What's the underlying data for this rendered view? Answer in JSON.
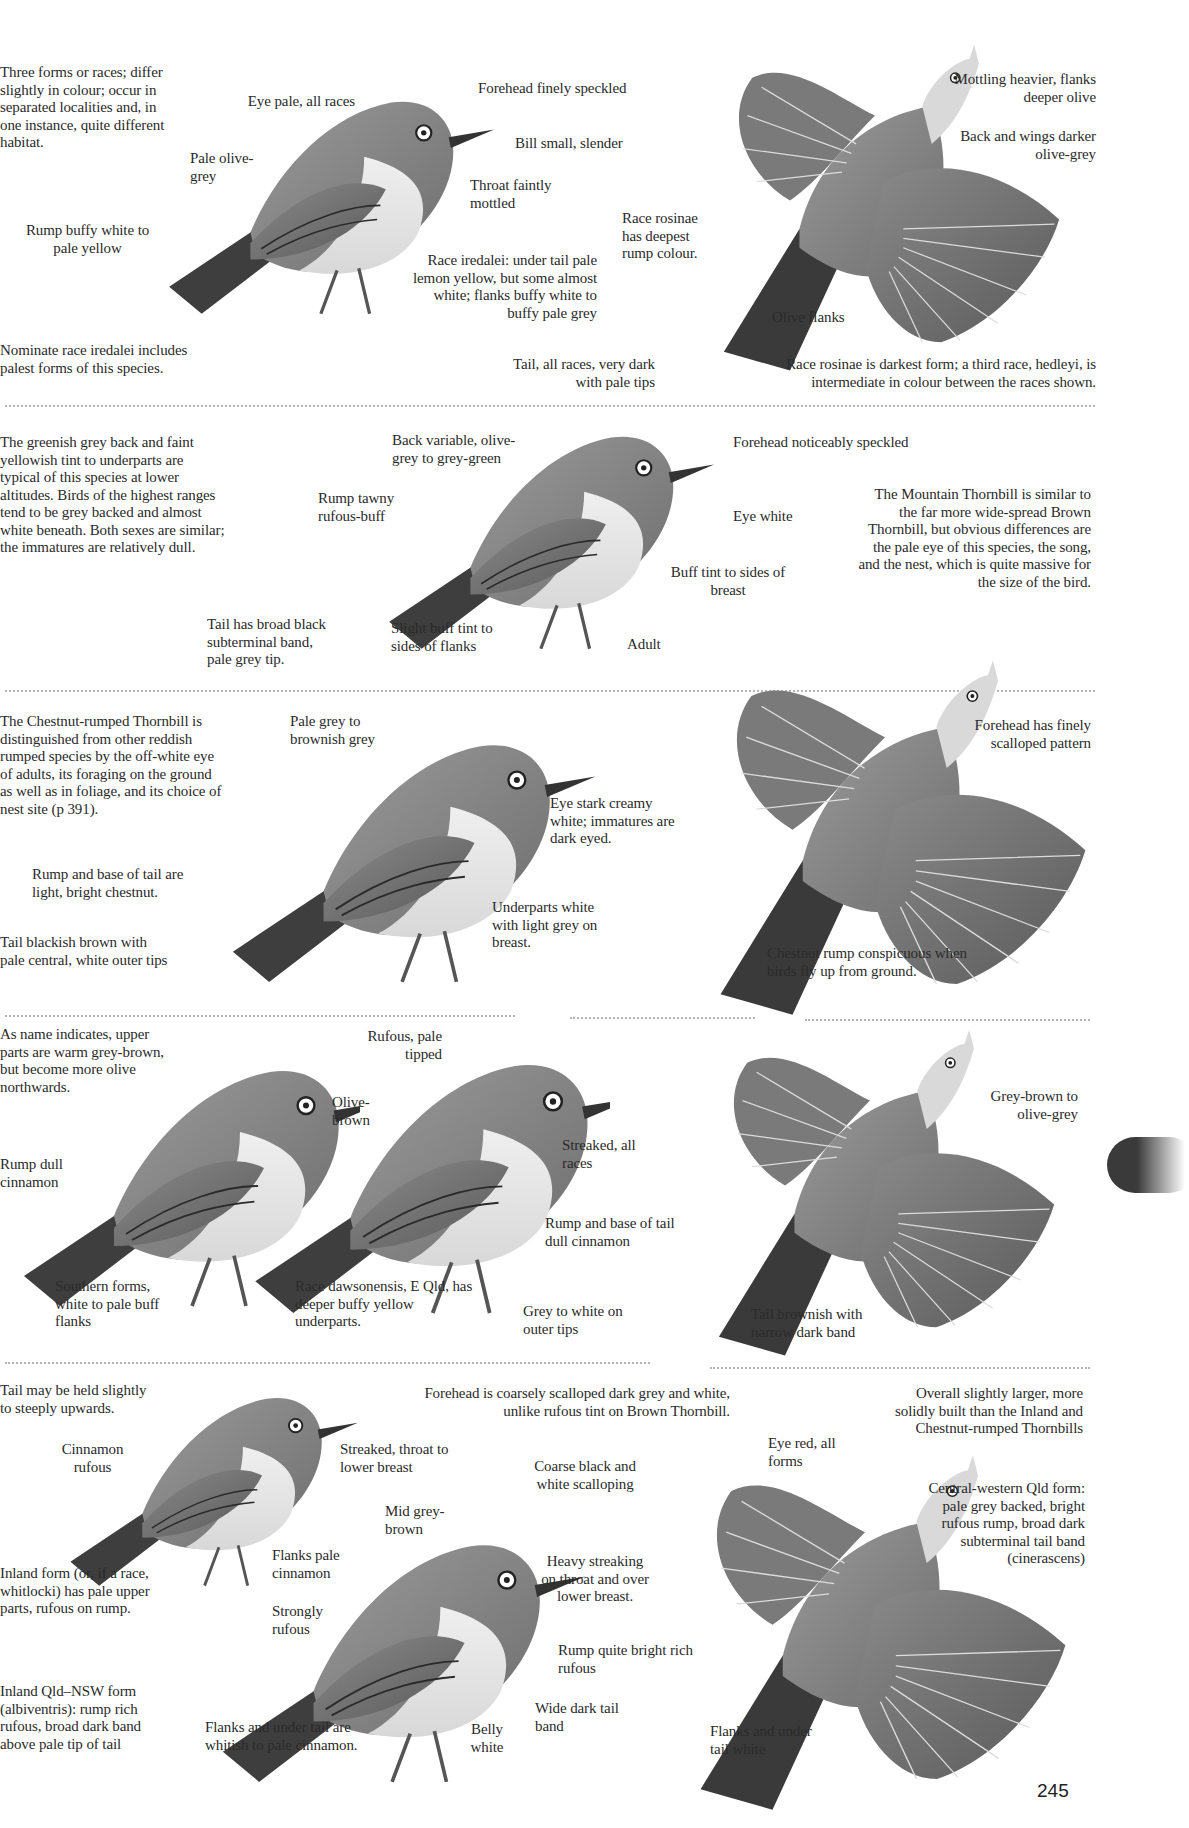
{
  "page": {
    "page_number": "245",
    "thumb_tab_color": "#3a3a3a"
  },
  "sections": [
    {
      "id": "section-1",
      "intro": "Three forms or races; differ slightly in colour; occur in separated localities and, in one instance, quite different habitat.",
      "footnote_left": "Nominate race iredalei includes palest forms of this species.",
      "footnote_right": "Race rosinae is darkest form; a third race, hedleyi, is intermediate in colour between the races shown.",
      "labels": [
        "Eye pale, all races",
        "Forehead finely speckled",
        "Bill small, slender",
        "Pale olive-grey",
        "Throat faintly mottled",
        "Rump buffy white to pale yellow",
        "Race iredalei: under tail pale lemon yellow, but some almost white; flanks buffy white to buffy pale grey",
        "Tail, all races, very dark with pale tips",
        "Race rosinae has deepest rump colour.",
        "Mottling heavier, flanks deeper olive",
        "Back and wings darker olive-grey",
        "Olive flanks"
      ]
    },
    {
      "id": "section-2",
      "intro": "The greenish grey back and faint yellowish tint to underparts are typical of this species at lower altitudes. Birds of the highest ranges tend to be grey backed and almost white beneath. Both sexes are similar; the immatures are relatively dull.",
      "side_note": "The Mountain Thornbill is similar to the far more wide-spread Brown Thornbill, but obvious differences are the pale eye of this species, the song, and the nest, which is quite massive for the size of the bird.",
      "labels": [
        "Back variable, olive-grey to grey-green",
        "Forehead noticeably speckled",
        "Rump tawny rufous-buff",
        "Eye white",
        "Buff tint to sides of breast",
        "Tail has broad black subterminal band, pale grey tip.",
        "Slight buff tint to sides of flanks",
        "Adult"
      ]
    },
    {
      "id": "section-3",
      "intro": "The Chestnut-rumped Thornbill is distinguished from other reddish rumped species by the off-white eye of adults, its foraging on the ground as well as in foliage, and its choice of nest site (p 391).",
      "labels": [
        "Pale grey to brownish grey",
        "Eye stark creamy white; immatures are dark eyed.",
        "Rump and base of tail are light, bright chestnut.",
        "Underparts white with light grey on breast.",
        "Tail blackish brown with pale central, white outer tips",
        "Forehead has finely scalloped pattern",
        "Chestnut rump conspicuous when birds fly up from ground."
      ]
    },
    {
      "id": "section-4",
      "intro": "As name indicates, upper parts are warm grey-brown, but become more olive northwards.",
      "labels": [
        "Rufous, pale tipped",
        "Olive-brown",
        "Rump dull cinnamon",
        "Streaked, all races",
        "Rump and base of tail dull cinnamon",
        "Southern forms, white to pale buff flanks",
        "Race dawsonensis, E Qld, has deeper buffy yellow underparts.",
        "Grey to white on outer tips",
        "Grey-brown to olive-grey",
        "Tail brownish with narrow dark band"
      ]
    },
    {
      "id": "section-5",
      "intro": "Tail may be held slightly to steeply upwards.",
      "labels": [
        "Forehead is coarsely scalloped dark grey and white, unlike rufous tint on Brown Thornbill.",
        "Overall slightly larger, more solidly built than the Inland and Chestnut-rumped Thornbills",
        "Cinnamon rufous",
        "Streaked, throat to lower breast",
        "Coarse black and white scalloping",
        "Eye red, all forms",
        "Central-western Qld form: pale grey backed, bright rufous rump, broad dark subterminal tail band (cinerascens)",
        "Mid grey-brown",
        "Inland form (or, if a race, whitlocki) has pale upper parts, rufous on rump.",
        "Flanks pale cinnamon",
        "Heavy streaking on throat and over lower breast.",
        "Strongly rufous",
        "Rump quite bright rich rufous",
        "Inland Qld–NSW form (albiventris): rump rich rufous, broad dark band above pale tip of tail",
        "Wide dark tail band",
        "Flanks and under tail are whitish to pale cinnamon.",
        "Belly white",
        "Flanks and under tail white"
      ]
    }
  ]
}
